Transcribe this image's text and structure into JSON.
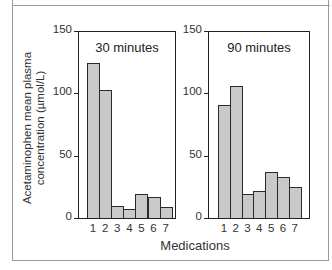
{
  "chart_data": [
    {
      "type": "bar",
      "title": "30 minutes",
      "categories": [
        "1",
        "2",
        "3",
        "4",
        "5",
        "6",
        "7"
      ],
      "values": [
        124,
        103,
        10,
        7,
        19,
        17,
        9
      ],
      "xlabel": "Medications",
      "ylabel": "Acetaminophen mean plasma concentration (µmol/L)",
      "ylim": [
        0,
        150
      ],
      "yticks": [
        0,
        50,
        100,
        150
      ],
      "grid": false,
      "legend": null
    },
    {
      "type": "bar",
      "title": "90 minutes",
      "categories": [
        "1",
        "2",
        "3",
        "4",
        "5",
        "6",
        "7"
      ],
      "values": [
        91,
        106,
        19,
        22,
        37,
        33,
        25
      ],
      "xlabel": "Medications",
      "ylabel": "Acetaminophen mean plasma concentration (µmol/L)",
      "ylim": [
        0,
        150
      ],
      "yticks": [
        0,
        50,
        100,
        150
      ],
      "grid": false,
      "legend": null
    }
  ],
  "labels": {
    "ylabel_line1": "Acetaminophen mean plasma",
    "ylabel_line2": "concentration (µmol/L)",
    "xlabel": "Medications",
    "panel1_title": "30 minutes",
    "panel2_title": "90 minutes",
    "yticks": [
      "0",
      "50",
      "100",
      "150"
    ],
    "xticks": [
      "1",
      "2",
      "3",
      "4",
      "5",
      "6",
      "7"
    ]
  },
  "colors": {
    "bar_fill": "#c9c9c9",
    "bar_edge": "#2a2a2a",
    "frame": "#9a9a9a"
  }
}
